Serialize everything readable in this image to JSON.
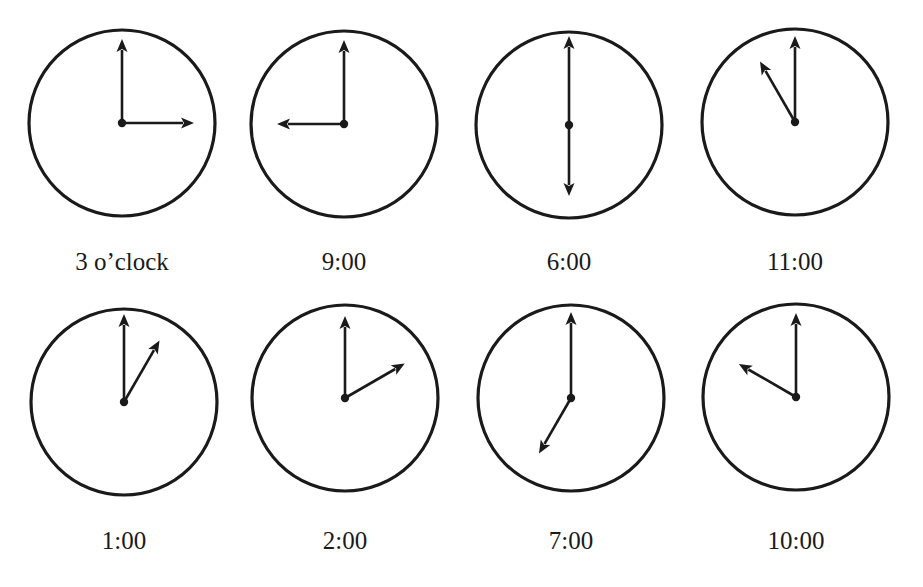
{
  "figure": {
    "colors": {
      "ink": "#1a1a1a",
      "background": "#ffffff"
    },
    "clocks": [
      {
        "label": "3  o’clock",
        "hour": 3,
        "cx": 122,
        "cy": 123,
        "r": 93,
        "label_y": 270,
        "minute_len": 84,
        "hour_len": 72
      },
      {
        "label": "9:00",
        "hour": 9,
        "cx": 344,
        "cy": 124,
        "r": 93,
        "label_y": 270,
        "minute_len": 84,
        "hour_len": 67
      },
      {
        "label": "6:00",
        "hour": 6,
        "cx": 569,
        "cy": 125,
        "r": 93,
        "label_y": 270,
        "minute_len": 89,
        "hour_len": 71
      },
      {
        "label": "11:00",
        "hour": 11,
        "cx": 795,
        "cy": 122,
        "r": 93,
        "label_y": 270,
        "minute_len": 86,
        "hour_len": 70
      },
      {
        "label": "1:00",
        "hour": 1,
        "cx": 124,
        "cy": 402,
        "r": 93,
        "label_y": 549,
        "minute_len": 88,
        "hour_len": 71
      },
      {
        "label": "2:00",
        "hour": 2,
        "cx": 345,
        "cy": 398,
        "r": 93,
        "label_y": 549,
        "minute_len": 82,
        "hour_len": 69
      },
      {
        "label": "7:00",
        "hour": 7,
        "cx": 571,
        "cy": 398,
        "r": 93,
        "label_y": 549,
        "minute_len": 86,
        "hour_len": 64
      },
      {
        "label": "10:00",
        "hour": 10,
        "cx": 796,
        "cy": 397,
        "r": 93,
        "label_y": 549,
        "minute_len": 84,
        "hour_len": 66
      }
    ]
  }
}
